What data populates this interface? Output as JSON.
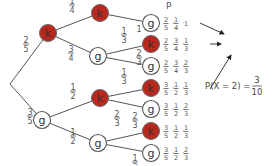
{
  "diagram": {
    "column_header": "P",
    "colors": {
      "k_fill": "#b8281c",
      "g_fill": "#ffffff",
      "line": "#555555"
    },
    "root": {
      "x": 10,
      "y": 84
    },
    "nodes": [
      {
        "id": "k1",
        "label": "k",
        "type": "k",
        "x": 48,
        "y": 33
      },
      {
        "id": "g1",
        "label": "g",
        "type": "g",
        "x": 42,
        "y": 120
      },
      {
        "id": "kk",
        "label": "k",
        "type": "k",
        "x": 100,
        "y": 13
      },
      {
        "id": "kg",
        "label": "g",
        "type": "g",
        "x": 98,
        "y": 56
      },
      {
        "id": "gk",
        "label": "k",
        "type": "k",
        "x": 100,
        "y": 98
      },
      {
        "id": "gg",
        "label": "g",
        "type": "g",
        "x": 98,
        "y": 143
      },
      {
        "id": "kkg",
        "label": "g",
        "type": "g",
        "x": 151,
        "y": 23
      },
      {
        "id": "kgk",
        "label": "k",
        "type": "k",
        "x": 151,
        "y": 44
      },
      {
        "id": "kgg",
        "label": "g",
        "type": "g",
        "x": 151,
        "y": 66
      },
      {
        "id": "gkk",
        "label": "k",
        "type": "k",
        "x": 151,
        "y": 88
      },
      {
        "id": "gkg",
        "label": "g",
        "type": "g",
        "x": 151,
        "y": 109
      },
      {
        "id": "ggk",
        "label": "k",
        "type": "k",
        "x": 151,
        "y": 131
      },
      {
        "id": "ggg",
        "label": "g",
        "type": "g",
        "x": 151,
        "y": 153
      }
    ],
    "edges": [
      {
        "from": "root",
        "to": "k1",
        "prob": [
          "2",
          "5"
        ],
        "lx": 26,
        "ly": 44
      },
      {
        "from": "root",
        "to": "g1",
        "prob": [
          "3",
          "5"
        ],
        "lx": 30,
        "ly": 116
      },
      {
        "from": "k1",
        "to": "kk",
        "prob": [
          "1",
          "4"
        ],
        "lx": 72,
        "ly": 5
      },
      {
        "from": "k1",
        "to": "kg",
        "prob": [
          "3",
          "4"
        ],
        "lx": 71,
        "ly": 53
      },
      {
        "from": "g1",
        "to": "gk",
        "prob": [
          "1",
          "2"
        ],
        "lx": 73,
        "ly": 91
      },
      {
        "from": "g1",
        "to": "gg",
        "prob": [
          "1",
          "2"
        ],
        "lx": 73,
        "ly": 136
      },
      {
        "from": "kk",
        "to": "kkg",
        "prob": [
          "1"
        ],
        "lx": 139,
        "ly": 32
      },
      {
        "from": "kg",
        "to": "kgk",
        "prob": [
          "1",
          "3"
        ],
        "lx": 124,
        "ly": 35
      },
      {
        "from": "kg",
        "to": "kgg",
        "prob": [
          "2",
          "3"
        ],
        "lx": 139,
        "ly": 57
      },
      {
        "from": "gk",
        "to": "gkk",
        "prob": [
          "1",
          "3"
        ],
        "lx": 124,
        "ly": 76
      },
      {
        "from": "gk",
        "to": "gkg",
        "prob": [
          "2",
          "3"
        ],
        "lx": 117,
        "ly": 118
      },
      {
        "from": "gg",
        "to": "ggk",
        "prob": [
          "2",
          "3"
        ],
        "lx": 135,
        "ly": 120
      },
      {
        "from": "gg",
        "to": "ggg",
        "prob": [
          "1",
          "3"
        ],
        "lx": 135,
        "ly": 162
      }
    ],
    "path_products": [
      {
        "y": 23,
        "factors": [
          [
            "2",
            "5"
          ],
          [
            "1",
            "4"
          ],
          [
            "1"
          ]
        ]
      },
      {
        "y": 44,
        "factors": [
          [
            "2",
            "5"
          ],
          [
            "3",
            "4"
          ],
          [
            "1",
            "3"
          ]
        ]
      },
      {
        "y": 66,
        "factors": [
          [
            "2",
            "5"
          ],
          [
            "3",
            "4"
          ],
          [
            "2",
            "3"
          ]
        ]
      },
      {
        "y": 88,
        "factors": [
          [
            "3",
            "5"
          ],
          [
            "1",
            "2"
          ],
          [
            "1",
            "3"
          ]
        ]
      },
      {
        "y": 109,
        "factors": [
          [
            "3",
            "5"
          ],
          [
            "1",
            "2"
          ],
          [
            "2",
            "3"
          ]
        ]
      },
      {
        "y": 131,
        "factors": [
          [
            "3",
            "5"
          ],
          [
            "1",
            "2"
          ],
          [
            "1",
            "3"
          ]
        ]
      },
      {
        "y": 153,
        "factors": [
          [
            "3",
            "5"
          ],
          [
            "1",
            "2"
          ],
          [
            "2",
            "3"
          ]
        ]
      }
    ],
    "result": {
      "text": "P(X = 2) =",
      "numerator": "3",
      "denominator": "10"
    }
  }
}
